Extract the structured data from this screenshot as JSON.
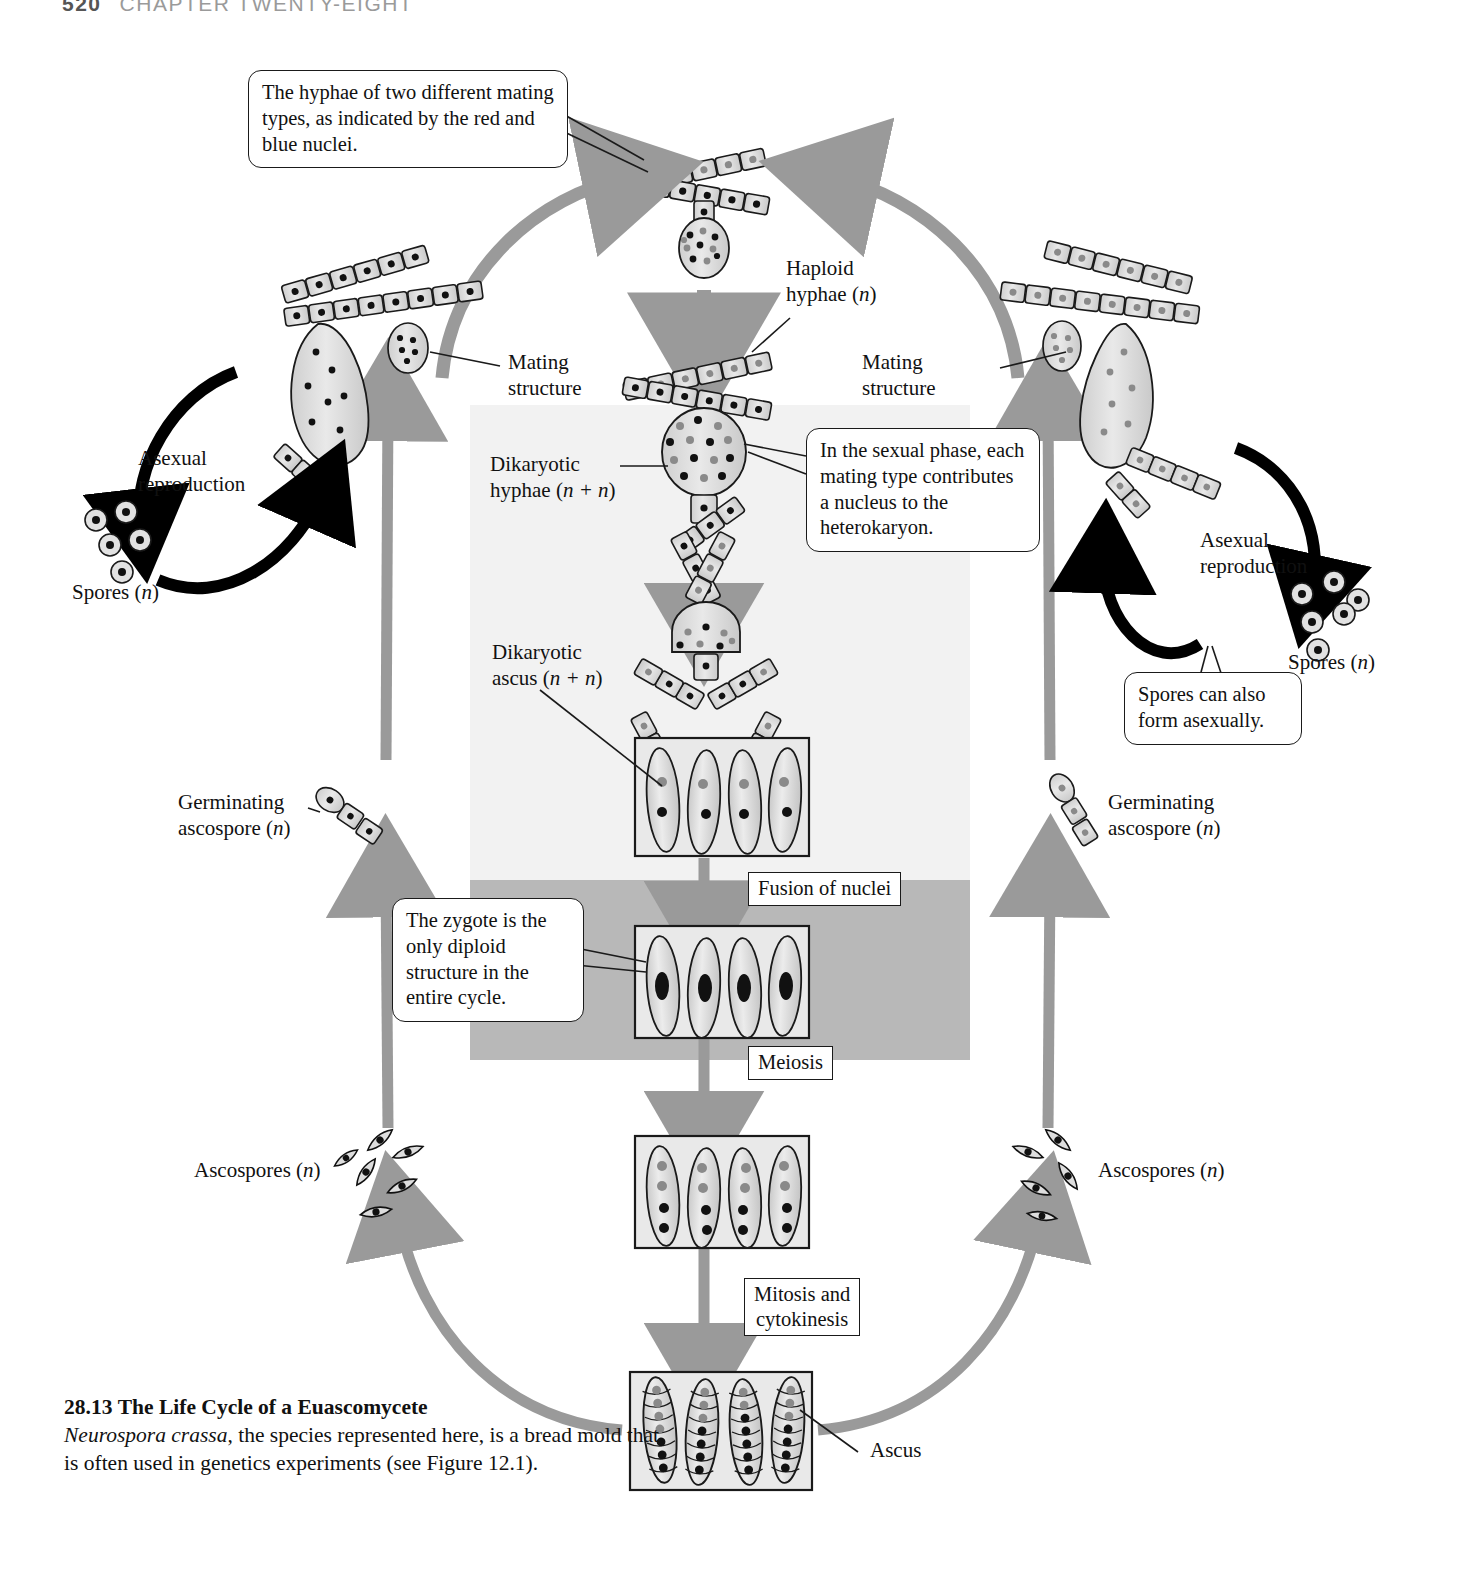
{
  "page": {
    "number": "520",
    "running_head": "CHAPTER TWENTY-EIGHT"
  },
  "caption": {
    "figure_number": "28.13",
    "title": "The Life Cycle of a Euascomycete",
    "body_species": "Neurospora crassa",
    "body_rest": ", the species represented here, is a bread mold that is often used in genetics experiments (see Figure 12.1)."
  },
  "callouts": [
    {
      "id": "hyphae-mating-types",
      "text": "The hyphae of two different mating types, as indicated by the red and blue nuclei."
    },
    {
      "id": "sexual-phase-nucleus",
      "text": "In the sexual phase, each mating type contributes a nucleus to the heterokaryon."
    },
    {
      "id": "zygote-diploid",
      "text": "The zygote is the only diploid structure in the entire cycle."
    },
    {
      "id": "spores-asexual",
      "text": "Spores can also form asexually."
    }
  ],
  "process_labels": [
    {
      "id": "fusion-of-nuclei",
      "text": "Fusion of nuclei"
    },
    {
      "id": "meiosis",
      "text": "Meiosis"
    },
    {
      "id": "mitosis-cytokinesis",
      "line1": "Mitosis and",
      "line2": "cytokinesis"
    }
  ],
  "structure_labels": {
    "haploid_hyphae": {
      "line1": "Haploid",
      "line2": "hyphae (",
      "italic": "n",
      "line2_end": ")"
    },
    "mating_structure_left": {
      "line1": "Mating",
      "line2": "structure"
    },
    "mating_structure_right": {
      "line1": "Mating",
      "line2": "structure"
    },
    "dikaryotic_hyphae": {
      "line1": "Dikaryotic",
      "line2_pre": "hyphae (",
      "italic": "n + n",
      "line2_end": ")"
    },
    "dikaryotic_ascus": {
      "line1": "Dikaryotic",
      "line2_pre": "ascus (",
      "italic": "n + n",
      "line2_end": ")"
    },
    "asexual_reproduction_left": {
      "line1": "Asexual",
      "line2": "reproduction"
    },
    "asexual_reproduction_right": {
      "line1": "Asexual",
      "line2": "reproduction"
    },
    "spores_left": {
      "pre": "Spores (",
      "italic": "n",
      "post": ")"
    },
    "spores_right": {
      "pre": "Spores (",
      "italic": "n",
      "post": ")"
    },
    "germinating_ascospore_left": {
      "line1": "Germinating",
      "line2_pre": "ascospore (",
      "italic": "n",
      "line2_end": ")"
    },
    "germinating_ascospore_right": {
      "line1": "Germinating",
      "line2_pre": "ascospore (",
      "italic": "n",
      "line2_end": ")"
    },
    "ascospores_left": {
      "pre": "Ascospores (",
      "italic": "n",
      "post": ")"
    },
    "ascospores_right": {
      "pre": "Ascospores (",
      "italic": "n",
      "post": ")"
    },
    "ascus": {
      "text": "Ascus"
    }
  },
  "colors": {
    "panel_sexual": "#f2f2f2",
    "panel_diploid": "#b8b8b8",
    "cycle_arrow": "#9a9a9a",
    "asexual_arrow": "#000000",
    "cell_fill": "#d9d9d9",
    "nucleus_red": "#111111",
    "nucleus_blue": "#8a8a8a",
    "outline": "#1a1a1a"
  }
}
